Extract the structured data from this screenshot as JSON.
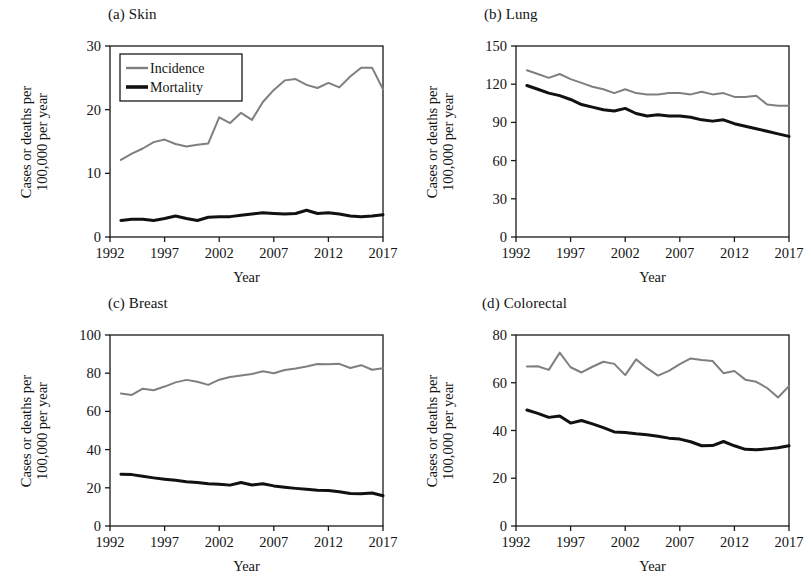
{
  "figure": {
    "background": "#ffffff",
    "series_colors": {
      "incidence": "#7f7f7f",
      "mortality": "#111111"
    },
    "axis_color": "#1a1a1a",
    "shared_xlabel": "Year",
    "shared_ylabel_line1": "Cases or deaths per",
    "shared_ylabel_line2": "100,000 per year",
    "legend": {
      "incidence_label": "Incidence",
      "mortality_label": "Mortality"
    }
  },
  "chart_data": [
    {
      "type": "line",
      "panel": "a",
      "title": "(a) Skin",
      "xlabel": "Year",
      "ylabel": "Cases or deaths per 100,000 per year",
      "xlim": [
        1992,
        2017
      ],
      "ylim": [
        0,
        30
      ],
      "xticks": [
        1992,
        1997,
        2002,
        2007,
        2012,
        2017
      ],
      "yticks": [
        0,
        10,
        20,
        30
      ],
      "grid": false,
      "legend_position": "top-left",
      "x": [
        1993,
        1994,
        1995,
        1996,
        1997,
        1998,
        1999,
        2000,
        2001,
        2002,
        2003,
        2004,
        2005,
        2006,
        2007,
        2008,
        2009,
        2010,
        2011,
        2012,
        2013,
        2014,
        2015,
        2016,
        2017
      ],
      "series": [
        {
          "name": "Incidence",
          "color": "#7f7f7f",
          "values": [
            12.1,
            13.1,
            13.9,
            14.9,
            15.3,
            14.6,
            14.2,
            14.5,
            14.7,
            18.8,
            17.9,
            19.5,
            18.4,
            21.2,
            23.1,
            24.6,
            24.8,
            23.9,
            23.4,
            24.2,
            23.5,
            25.2,
            26.6,
            26.6,
            23.2
          ]
        },
        {
          "name": "Mortality",
          "color": "#111111",
          "values": [
            2.6,
            2.8,
            2.8,
            2.6,
            2.9,
            3.3,
            2.9,
            2.6,
            3.1,
            3.2,
            3.2,
            3.4,
            3.6,
            3.8,
            3.7,
            3.6,
            3.7,
            4.2,
            3.7,
            3.8,
            3.6,
            3.3,
            3.2,
            3.3,
            3.5
          ]
        }
      ]
    },
    {
      "type": "line",
      "panel": "b",
      "title": "(b) Lung",
      "xlabel": "Year",
      "ylabel": "Cases or deaths per 100,000 per year",
      "xlim": [
        1992,
        2017
      ],
      "ylim": [
        0,
        150
      ],
      "xticks": [
        1992,
        1997,
        2002,
        2007,
        2012,
        2017
      ],
      "yticks": [
        0,
        30,
        60,
        90,
        120,
        150
      ],
      "grid": false,
      "x": [
        1993,
        1994,
        1995,
        1996,
        1997,
        1998,
        1999,
        2000,
        2001,
        2002,
        2003,
        2004,
        2005,
        2006,
        2007,
        2008,
        2009,
        2010,
        2011,
        2012,
        2013,
        2014,
        2015,
        2016,
        2017
      ],
      "series": [
        {
          "name": "Incidence",
          "color": "#7f7f7f",
          "values": [
            131,
            128,
            125,
            128,
            124,
            121,
            118,
            116,
            113,
            116,
            113,
            112,
            112,
            113,
            113,
            112,
            114,
            112,
            113,
            110,
            110,
            111,
            104,
            103,
            103
          ]
        },
        {
          "name": "Mortality",
          "color": "#111111",
          "values": [
            119,
            116,
            113,
            111,
            108,
            104,
            102,
            100,
            99,
            101,
            97,
            95,
            96,
            95,
            95,
            94,
            92,
            91,
            92,
            89,
            87,
            85,
            83,
            81,
            79
          ]
        }
      ]
    },
    {
      "type": "line",
      "panel": "c",
      "title": "(c) Breast",
      "xlabel": "Year",
      "ylabel": "Cases or deaths per 100,000 per year",
      "xlim": [
        1992,
        2017
      ],
      "ylim": [
        0,
        100
      ],
      "xticks": [
        1992,
        1997,
        2002,
        2007,
        2012,
        2017
      ],
      "yticks": [
        0,
        20,
        40,
        60,
        80,
        100
      ],
      "grid": false,
      "x": [
        1993,
        1994,
        1995,
        1996,
        1997,
        1998,
        1999,
        2000,
        2001,
        2002,
        2003,
        2004,
        2005,
        2006,
        2007,
        2008,
        2009,
        2010,
        2011,
        2012,
        2013,
        2014,
        2015,
        2016,
        2017
      ],
      "series": [
        {
          "name": "Incidence",
          "color": "#7f7f7f",
          "values": [
            69.4,
            68.6,
            71.9,
            71.1,
            73.0,
            75.2,
            76.5,
            75.5,
            73.9,
            76.6,
            78.0,
            78.8,
            79.6,
            81.0,
            80.0,
            81.7,
            82.5,
            83.5,
            84.8,
            84.7,
            84.9,
            82.7,
            84.2,
            81.8,
            82.6
          ]
        },
        {
          "name": "Mortality",
          "color": "#111111",
          "values": [
            27.1,
            26.9,
            26.0,
            25.2,
            24.5,
            23.9,
            23.2,
            22.8,
            22.1,
            21.9,
            21.4,
            22.8,
            21.5,
            22.1,
            21.0,
            20.3,
            19.7,
            19.2,
            18.7,
            18.6,
            17.9,
            17.0,
            16.9,
            17.3,
            15.8
          ]
        }
      ]
    },
    {
      "type": "line",
      "panel": "d",
      "title": "(d) Colorectal",
      "xlabel": "Year",
      "ylabel": "Cases or deaths per 100,000 per year",
      "xlim": [
        1992,
        2017
      ],
      "ylim": [
        0,
        80
      ],
      "xticks": [
        1992,
        1997,
        2002,
        2007,
        2012,
        2017
      ],
      "yticks": [
        0,
        20,
        40,
        60,
        80
      ],
      "grid": false,
      "x": [
        1993,
        1994,
        1995,
        1996,
        1997,
        1998,
        1999,
        2000,
        2001,
        2002,
        2003,
        2004,
        2005,
        2006,
        2007,
        2008,
        2009,
        2010,
        2011,
        2012,
        2013,
        2014,
        2015,
        2016,
        2017
      ],
      "series": [
        {
          "name": "Incidence",
          "color": "#7f7f7f",
          "values": [
            66.8,
            66.9,
            65.4,
            72.6,
            66.5,
            64.3,
            66.7,
            68.8,
            67.9,
            63.2,
            69.8,
            66.1,
            63.0,
            65.0,
            67.8,
            70.2,
            69.5,
            69.1,
            64.0,
            64.9,
            61.3,
            60.4,
            57.8,
            53.8,
            58.6
          ]
        },
        {
          "name": "Mortality",
          "color": "#111111",
          "values": [
            48.6,
            47.2,
            45.5,
            46.1,
            43.1,
            44.2,
            42.8,
            41.2,
            39.4,
            39.2,
            38.6,
            38.2,
            37.6,
            36.8,
            36.4,
            35.3,
            33.6,
            33.7,
            35.4,
            33.6,
            32.1,
            31.9,
            32.3,
            32.8,
            33.6
          ]
        }
      ]
    }
  ]
}
